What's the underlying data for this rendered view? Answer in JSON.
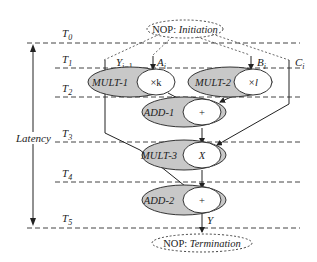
{
  "diagram": {
    "type": "scheduled dataflow graph",
    "time_steps": [
      "T0",
      "T1",
      "T2",
      "T3",
      "T4",
      "T5"
    ],
    "latency_label": "Latency",
    "start_node": {
      "prefix": "NOP: ",
      "name": "Initiation"
    },
    "end_node": {
      "prefix": "NOP: ",
      "name": "Termination"
    },
    "inputs": [
      {
        "id": "Y",
        "label": "Y",
        "sub": "i−1"
      },
      {
        "id": "A",
        "label": "A",
        "sub": "i"
      },
      {
        "id": "B",
        "label": "B",
        "sub": "i"
      },
      {
        "id": "C",
        "label": "C",
        "sub": "i"
      }
    ],
    "operations": [
      {
        "id": "mult1",
        "name": "MULT-1",
        "op": "×k",
        "step": "T1–T2"
      },
      {
        "id": "mult2",
        "name": "MULT-2",
        "op": "×l",
        "step": "T1–T2"
      },
      {
        "id": "add1",
        "name": "ADD-1",
        "op": "+",
        "step": "T2–T3"
      },
      {
        "id": "mult3",
        "name": "MULT-3",
        "op": "X",
        "step": "T3–T4"
      },
      {
        "id": "add2",
        "name": "ADD-2",
        "op": "+",
        "step": "T4–T5"
      }
    ],
    "output": {
      "label": "Y"
    }
  },
  "colors": {
    "op_fill": "#c8c8c8",
    "inner_fill": "#ffffff",
    "line": "#222222",
    "dash": "#444444"
  }
}
